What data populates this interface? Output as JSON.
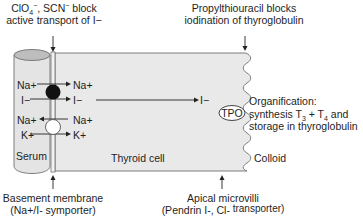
{
  "title_labels": {
    "top_left": {
      "line1_prefix": "ClO",
      "line1_sub": "4",
      "line1_sup": "−",
      "line1_mid": ", SCN",
      "line1_sup2": "−",
      "line1_suffix": " block",
      "line2": "active transport of I−"
    },
    "top_right": {
      "line1": "Propylthiouracil blocks",
      "line2": "iodination of thyroglobulin"
    },
    "bottom_left": {
      "line1": "Basement membrane",
      "line2": "(Na+/I- symporter)"
    },
    "bottom_right": {
      "line1": "Apical microvilli",
      "line2_main": "(Pendrin I-, Cl-",
      "line2_raised": " transporter)"
    }
  },
  "regions": {
    "serum": "Serum",
    "thyroid_cell": "Thyroid cell",
    "colloid": "Colloid",
    "enzyme": "TPO"
  },
  "transport": {
    "symporter_left": [
      "Na+",
      "I−"
    ],
    "symporter_right": [
      "Na+",
      "I−"
    ],
    "pump_left": [
      "Na+",
      "K+"
    ],
    "pump_right": [
      "Na+",
      "K+"
    ],
    "apical_ion": "I−"
  },
  "organification": {
    "line1": "Organification:",
    "line2_prefix": "synthesis T",
    "line2_sub1": "3",
    "line2_mid": " + T",
    "line2_sub2": "4",
    "line2_suffix": " and",
    "line3": "storage in thyroglobulin"
  },
  "colors": {
    "cell_fill": "#e9e9e9",
    "serum_fill": "#e6e6e6",
    "serum_top": "#bdbdbd",
    "outline": "#6e6e6e",
    "symporter": "#111111",
    "pump": "#ffffff"
  }
}
